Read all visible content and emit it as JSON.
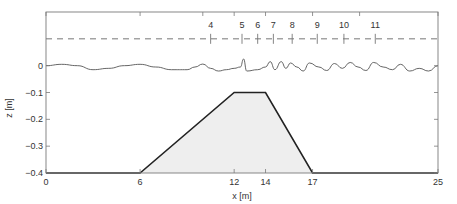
{
  "chart_data": {
    "type": "line",
    "title": "",
    "xlabel": "x [m]",
    "ylabel": "z [m]",
    "xlim": [
      0,
      25
    ],
    "ylim": [
      -0.4,
      0.2
    ],
    "grid": false,
    "x_ticks": [
      0,
      6,
      12,
      14,
      17,
      25
    ],
    "y_ticks": [
      0,
      -0.1,
      -0.2,
      -0.3,
      -0.4
    ],
    "y_tick_labels": [
      "0",
      "-0.1",
      "-0.2",
      "-0.3",
      "-0.4"
    ],
    "series": [
      {
        "name": "bottom profile (submerged trapezoidal bar)",
        "style": "solid-thick-filled",
        "x": [
          0,
          6,
          12,
          14,
          17,
          25
        ],
        "z": [
          -0.4,
          -0.4,
          -0.1,
          -0.1,
          -0.4,
          -0.4
        ]
      },
      {
        "name": "free surface elevation (snapshot)",
        "style": "solid-thin",
        "x": [
          0,
          1,
          2,
          3,
          4,
          5,
          6,
          7,
          8,
          9,
          9.5,
          10,
          10.5,
          11,
          11.5,
          12,
          12.4,
          12.6,
          12.8,
          13.5,
          14,
          14.3,
          14.6,
          15,
          15.3,
          15.6,
          16,
          16.4,
          16.8,
          17.4,
          17.9,
          18.4,
          18.9,
          19.4,
          19.9,
          20.4,
          20.9,
          21.5,
          22.1,
          22.6,
          23.2,
          23.8,
          24.4,
          25
        ],
        "z": [
          0.0,
          0.005,
          0.0,
          -0.015,
          -0.01,
          0.0,
          0.005,
          -0.005,
          -0.015,
          -0.015,
          -0.005,
          0.006,
          -0.01,
          -0.02,
          -0.015,
          -0.01,
          -0.005,
          0.025,
          -0.02,
          -0.015,
          -0.005,
          0.015,
          -0.015,
          0.015,
          -0.01,
          0.01,
          -0.005,
          -0.02,
          0.01,
          -0.005,
          -0.018,
          0.008,
          -0.01,
          0.012,
          -0.005,
          -0.018,
          0.012,
          -0.005,
          -0.015,
          0.005,
          -0.02,
          -0.01,
          -0.02,
          0.0
        ]
      },
      {
        "name": "still water / gauge reference line",
        "style": "dashed",
        "x": [
          0,
          25
        ],
        "z": [
          0.1,
          0.1
        ]
      }
    ],
    "annotations": [
      {
        "label": "4",
        "x": 10.5
      },
      {
        "label": "5",
        "x": 12.5
      },
      {
        "label": "6",
        "x": 13.5
      },
      {
        "label": "7",
        "x": 14.5
      },
      {
        "label": "8",
        "x": 15.7
      },
      {
        "label": "9",
        "x": 17.3
      },
      {
        "label": "10",
        "x": 19.0
      },
      {
        "label": "11",
        "x": 21.0
      }
    ],
    "colors": {
      "axes": "#7a7a7a",
      "profile": "#222222",
      "fill": "#eeeeee",
      "surface": "#555555",
      "dashed": "#777777"
    }
  }
}
